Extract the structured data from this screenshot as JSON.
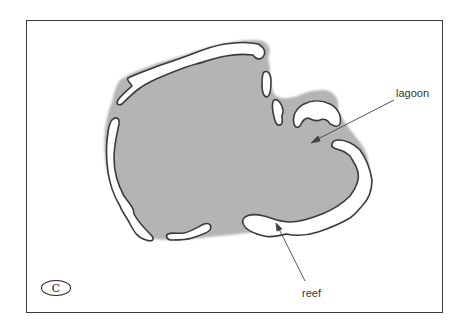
{
  "diagram": {
    "panel_letter": "C",
    "labels": {
      "lagoon": "lagoon",
      "reef": "reef"
    },
    "colors": {
      "lagoon_fill": "#b4b4b4",
      "reef_fill": "#ffffff",
      "reef_outline": "#3a3a3a",
      "frame": "#3a3a3a",
      "leader_line": "#444444"
    }
  }
}
